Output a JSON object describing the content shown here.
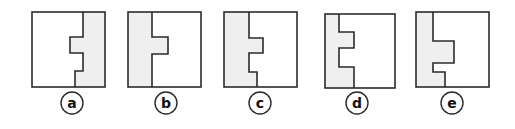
{
  "colors": {
    "stroke": "#2b2b2b",
    "shade": "#efefef",
    "background": "#ffffff"
  },
  "options": [
    {
      "label": "a",
      "box": {
        "x": 32,
        "y": 12,
        "w": 73,
        "h": 75
      },
      "shade_points": "83,12 105,12 105,87 75,87 75,71 83,71 83,53 70,53 70,37 83,37",
      "cut_path": "M83,12 L83,37 L70,37 L70,53 L83,53 L83,71 L75,71 L75,87",
      "circle": {
        "cx": 72,
        "cy": 103
      }
    },
    {
      "label": "b",
      "box": {
        "x": 128,
        "y": 12,
        "w": 73,
        "h": 75
      },
      "shade_points": "128,12 152,12 152,37 168,37 168,54 152,54 152,87 128,87",
      "cut_path": "M152,12 L152,37 L168,37 L168,54 L152,54 L152,87",
      "circle": {
        "cx": 166,
        "cy": 103
      }
    },
    {
      "label": "c",
      "box": {
        "x": 224,
        "y": 12,
        "w": 73,
        "h": 75
      },
      "shade_points": "224,12 249,12 249,38 263,38 263,53 249,53 249,72 257,72 257,87 224,87",
      "cut_path": "M249,12 L249,38 L263,38 L263,53 L249,53 L249,72 L257,72 L257,87",
      "circle": {
        "cx": 260,
        "cy": 103
      }
    },
    {
      "label": "d",
      "box": {
        "x": 325,
        "y": 14,
        "w": 70,
        "h": 74
      },
      "shade_points": "325,14 339,14 339,32 354,32 354,48 339,48 339,67 354,67 354,88 325,88",
      "cut_path": "M339,14 L339,32 L354,32 L354,48 L339,48 L339,67 L354,67 L354,88",
      "circle": {
        "cx": 357,
        "cy": 103
      }
    },
    {
      "label": "e",
      "box": {
        "x": 416,
        "y": 12,
        "w": 73,
        "h": 75
      },
      "shade_points": "416,12 433,12 433,41 454,41 454,63 433,63 433,72 445,72 445,87 416,87",
      "cut_path": "M433,12 L433,41 L454,41 L454,63 L433,63 L433,72 L445,72 L445,87",
      "circle": {
        "cx": 452,
        "cy": 103
      }
    }
  ]
}
